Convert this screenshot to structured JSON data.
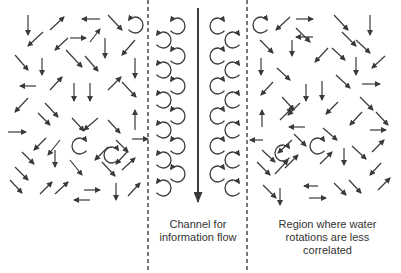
{
  "diagram": {
    "colors": {
      "arrow": "#3a3a3a",
      "dash": "#555555",
      "background": "#ffffff"
    },
    "labels": {
      "channel_line1": "Channel for",
      "channel_line2": "information flow",
      "region_line1": "Region where water",
      "region_line2": "rotations are less",
      "region_line3": "correlated"
    },
    "dividers": [
      {
        "x": 148,
        "y1": 0,
        "y2": 273
      },
      {
        "x": 247,
        "y1": 0,
        "y2": 273
      }
    ],
    "channel_arrow": {
      "x": 198,
      "y1": 8,
      "y2": 202
    },
    "channel_rotations": {
      "left_column": [
        {
          "cx": 177,
          "cy": 26
        },
        {
          "cx": 163,
          "cy": 40
        },
        {
          "cx": 177,
          "cy": 56
        },
        {
          "cx": 163,
          "cy": 70
        },
        {
          "cx": 177,
          "cy": 86
        },
        {
          "cx": 163,
          "cy": 100
        },
        {
          "cx": 177,
          "cy": 116
        },
        {
          "cx": 163,
          "cy": 130
        },
        {
          "cx": 177,
          "cy": 146
        },
        {
          "cx": 163,
          "cy": 160
        },
        {
          "cx": 177,
          "cy": 174
        },
        {
          "cx": 163,
          "cy": 188
        }
      ],
      "right_column": [
        {
          "cx": 218,
          "cy": 26
        },
        {
          "cx": 233,
          "cy": 40
        },
        {
          "cx": 218,
          "cy": 56
        },
        {
          "cx": 233,
          "cy": 70
        },
        {
          "cx": 218,
          "cy": 86
        },
        {
          "cx": 233,
          "cy": 100
        },
        {
          "cx": 218,
          "cy": 116
        },
        {
          "cx": 233,
          "cy": 130
        },
        {
          "cx": 218,
          "cy": 146
        },
        {
          "cx": 233,
          "cy": 160
        },
        {
          "cx": 218,
          "cy": 174
        },
        {
          "cx": 233,
          "cy": 188
        }
      ]
    },
    "disordered_rotations": [
      {
        "cx": 135,
        "cy": 25,
        "open": "left"
      },
      {
        "cx": 80,
        "cy": 146,
        "open": "right"
      },
      {
        "cx": 112,
        "cy": 155,
        "open": "right"
      },
      {
        "cx": 261,
        "cy": 25,
        "open": "right"
      },
      {
        "cx": 283,
        "cy": 153,
        "open": "right"
      },
      {
        "cx": 318,
        "cy": 146,
        "open": "right"
      }
    ],
    "left_region_arrows": [
      [
        28,
        15,
        28,
        35
      ],
      [
        43,
        32,
        28,
        46
      ],
      [
        50,
        30,
        64,
        17
      ],
      [
        68,
        38,
        55,
        50
      ],
      [
        100,
        19,
        82,
        19
      ],
      [
        108,
        15,
        122,
        30
      ],
      [
        70,
        38,
        86,
        38
      ],
      [
        90,
        42,
        100,
        29
      ],
      [
        105,
        38,
        105,
        58
      ],
      [
        135,
        40,
        122,
        55
      ],
      [
        15,
        55,
        28,
        70
      ],
      [
        42,
        58,
        42,
        75
      ],
      [
        66,
        50,
        82,
        67
      ],
      [
        85,
        56,
        98,
        71
      ],
      [
        135,
        58,
        135,
        78
      ],
      [
        36,
        86,
        20,
        86
      ],
      [
        50,
        90,
        62,
        77
      ],
      [
        74,
        83,
        74,
        101
      ],
      [
        90,
        83,
        90,
        101
      ],
      [
        108,
        90,
        121,
        77
      ],
      [
        122,
        82,
        136,
        97
      ],
      [
        28,
        98,
        15,
        112
      ],
      [
        45,
        103,
        58,
        117
      ],
      [
        38,
        113,
        50,
        125
      ],
      [
        72,
        118,
        84,
        131
      ],
      [
        98,
        118,
        84,
        130
      ],
      [
        108,
        120,
        120,
        133
      ],
      [
        135,
        130,
        135,
        110
      ],
      [
        8,
        132,
        26,
        132
      ],
      [
        46,
        138,
        34,
        150
      ],
      [
        55,
        150,
        55,
        167
      ],
      [
        70,
        160,
        82,
        175
      ],
      [
        108,
        147,
        95,
        160
      ],
      [
        116,
        140,
        128,
        152
      ],
      [
        132,
        139,
        148,
        139
      ],
      [
        22,
        152,
        34,
        164
      ],
      [
        15,
        167,
        28,
        180
      ],
      [
        60,
        140,
        48,
        155
      ],
      [
        102,
        162,
        115,
        176
      ],
      [
        122,
        170,
        135,
        158
      ],
      [
        128,
        151,
        116,
        164
      ],
      [
        10,
        180,
        22,
        193
      ],
      [
        40,
        194,
        52,
        182
      ],
      [
        55,
        194,
        68,
        182
      ],
      [
        84,
        190,
        100,
        190
      ],
      [
        90,
        200,
        74,
        200
      ],
      [
        116,
        183,
        116,
        200
      ],
      [
        128,
        196,
        140,
        183
      ]
    ],
    "right_region_arrows": [
      [
        290,
        17,
        276,
        30
      ],
      [
        296,
        19,
        313,
        19
      ],
      [
        334,
        15,
        348,
        30
      ],
      [
        370,
        15,
        370,
        35
      ],
      [
        296,
        28,
        310,
        42
      ],
      [
        313,
        37,
        296,
        37
      ],
      [
        342,
        32,
        356,
        46
      ],
      [
        356,
        40,
        370,
        53
      ],
      [
        260,
        40,
        273,
        53
      ],
      [
        292,
        40,
        292,
        56
      ],
      [
        328,
        48,
        315,
        62
      ],
      [
        332,
        48,
        345,
        60
      ],
      [
        261,
        58,
        261,
        75
      ],
      [
        277,
        68,
        290,
        80
      ],
      [
        356,
        57,
        356,
        75
      ],
      [
        385,
        56,
        372,
        68
      ],
      [
        273,
        82,
        261,
        95
      ],
      [
        306,
        84,
        306,
        101
      ],
      [
        322,
        81,
        322,
        100
      ],
      [
        336,
        75,
        350,
        88
      ],
      [
        362,
        84,
        380,
        84
      ],
      [
        282,
        97,
        294,
        110
      ],
      [
        300,
        103,
        288,
        115
      ],
      [
        338,
        102,
        326,
        114
      ],
      [
        360,
        97,
        373,
        110
      ],
      [
        362,
        112,
        350,
        125
      ],
      [
        376,
        112,
        388,
        125
      ],
      [
        262,
        127,
        262,
        110
      ],
      [
        280,
        120,
        292,
        108
      ],
      [
        305,
        127,
        289,
        127
      ],
      [
        323,
        128,
        337,
        140
      ],
      [
        370,
        130,
        386,
        130
      ],
      [
        263,
        140,
        250,
        140
      ],
      [
        292,
        140,
        278,
        153
      ],
      [
        294,
        134,
        306,
        146
      ],
      [
        344,
        148,
        344,
        165
      ],
      [
        352,
        146,
        366,
        159
      ],
      [
        372,
        152,
        384,
        140
      ],
      [
        262,
        150,
        275,
        162
      ],
      [
        257,
        162,
        270,
        175
      ],
      [
        275,
        174,
        288,
        160
      ],
      [
        285,
        168,
        298,
        155
      ],
      [
        320,
        164,
        332,
        152
      ],
      [
        381,
        163,
        370,
        175
      ],
      [
        280,
        188,
        280,
        205
      ],
      [
        263,
        185,
        276,
        198
      ],
      [
        318,
        186,
        304,
        186
      ],
      [
        309,
        198,
        326,
        198
      ],
      [
        334,
        183,
        346,
        195
      ],
      [
        349,
        180,
        361,
        193
      ],
      [
        378,
        190,
        390,
        178
      ]
    ]
  }
}
